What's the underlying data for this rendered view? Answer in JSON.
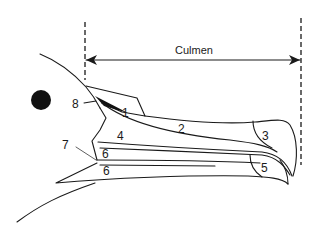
{
  "diagram": {
    "measurement": {
      "label": "Culmen",
      "type": "double-headed arrow between dashed reference lines"
    },
    "part_labels": [
      {
        "id": "1",
        "text": "1"
      },
      {
        "id": "2",
        "text": "2"
      },
      {
        "id": "3",
        "text": "3"
      },
      {
        "id": "4",
        "text": "4"
      },
      {
        "id": "5",
        "text": "5"
      },
      {
        "id": "6a",
        "text": "6"
      },
      {
        "id": "6b",
        "text": "6"
      },
      {
        "id": "7",
        "text": "7"
      },
      {
        "id": "8",
        "text": "8"
      }
    ],
    "colors": {
      "line": "#1a1a1a",
      "background": "#ffffff"
    }
  }
}
